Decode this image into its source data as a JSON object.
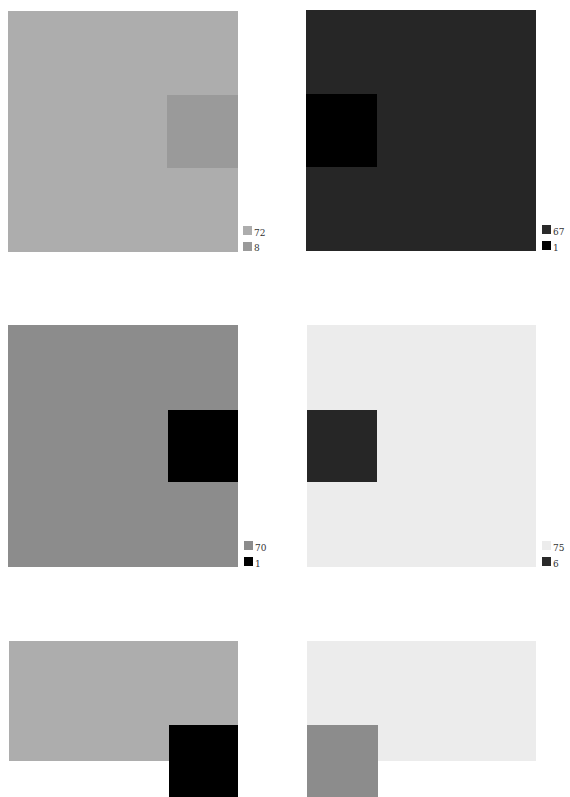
{
  "panels": [
    {
      "id": 1,
      "outer_color": "#adadad",
      "inner_color": "#9a9a9a",
      "inner_side": "right",
      "legend": [
        {
          "label": "72",
          "color": "#adadad"
        },
        {
          "label": "8",
          "color": "#9a9a9a"
        }
      ]
    },
    {
      "id": 2,
      "outer_color": "#262626",
      "inner_color": "#000000",
      "inner_side": "left",
      "legend": [
        {
          "label": "67",
          "color": "#2a2a2a"
        },
        {
          "label": "1",
          "color": "#000000"
        }
      ]
    },
    {
      "id": 3,
      "outer_color": "#8c8c8c",
      "inner_color": "#000000",
      "inner_side": "right",
      "legend": [
        {
          "label": "70",
          "color": "#8c8c8c"
        },
        {
          "label": "1",
          "color": "#000000"
        }
      ]
    },
    {
      "id": 4,
      "outer_color": "#ececec",
      "inner_color": "#262626",
      "inner_side": "left",
      "legend": [
        {
          "label": "75",
          "color": "#ececec"
        },
        {
          "label": "6",
          "color": "#2a2a2a"
        }
      ]
    },
    {
      "id": 5,
      "outer_color": "#adadad",
      "inner_color": "#000000",
      "inner_side": "right",
      "legend": []
    },
    {
      "id": 6,
      "outer_color": "#ececec",
      "inner_color": "#8c8c8c",
      "inner_side": "left",
      "legend": []
    }
  ]
}
